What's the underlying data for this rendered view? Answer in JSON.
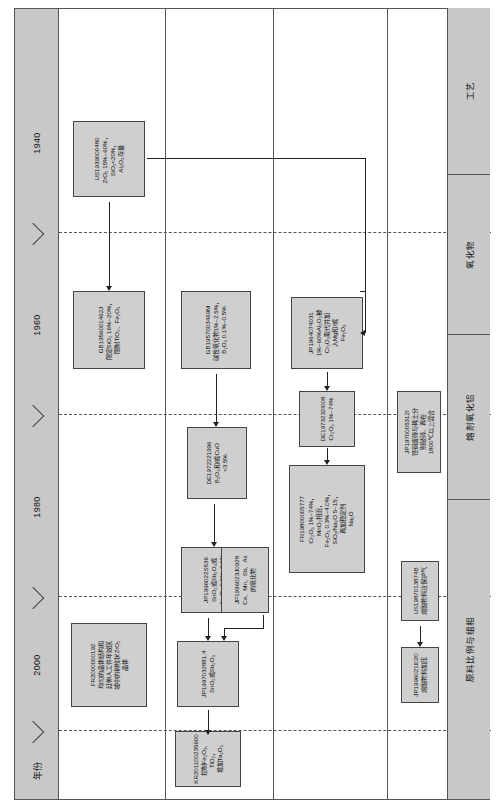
{
  "diagram": {
    "axis": {
      "header_label": "年份",
      "ticks": [
        "1940",
        "1960",
        "1980",
        "2000"
      ]
    },
    "lanes": [
      {
        "id": "lane-raw-material",
        "label": "原料比例与组相"
      },
      {
        "id": "lane-flux",
        "label": "熔剂氧化铝"
      },
      {
        "id": "lane-oxide",
        "label": "氧化物"
      },
      {
        "id": "lane-process",
        "label": "工艺"
      }
    ],
    "nodes": [
      {
        "id": "us1939000480",
        "lane": "lane-raw-material",
        "pid": "US1939000480",
        "desc": "ZrO₂ 15%~60%，\nSiO₂<20%，\nAl₂O₃存量"
      },
      {
        "id": "gb1956001462j",
        "lane": "lane-raw-material",
        "pid": "GB1956001462J",
        "desc": "限定SiO₂ 16%~20%，\n限制TiO₂、Fe₂O₃"
      },
      {
        "id": "fr2000000192",
        "lane": "lane-raw-material",
        "pid": "FR2000000192",
        "desc": "均匀的晶体结构和\n延伸人工件年效区\n域中的树枝状ZrO₂\n晶体"
      },
      {
        "id": "gb1957003469m",
        "lane": "lane-flux",
        "pid": "GB1957003469M",
        "desc": "碱性氧化物1%~2.5%，\nB₂O₃ 0.1%~0.5%"
      },
      {
        "id": "de1972221996",
        "lane": "lane-flux",
        "pid": "DE1972221996",
        "desc": "B₂O₃和/或CuO\n<3.5%"
      },
      {
        "id": "jp1996022s536",
        "lane": "lane-flux",
        "pid": "JP1996022S536",
        "desc": "SnO₂或Sb₂O₃或\nAs₂O₃ 0.1%~3.0%"
      },
      {
        "id": "jp1996023j0928",
        "lane": "lane-flux",
        "pid": "JP1996023J0928",
        "desc": "Ce、Mn、Sb、As\n的氧化物"
      },
      {
        "id": "jp1997032881.4",
        "lane": "lane-flux",
        "pid": "JP1997032881.4",
        "desc": "SnO₂或Sb₂O₃"
      },
      {
        "id": "kr201100235600",
        "lane": "lane-flux",
        "pid": "KR201100235600",
        "desc": "控制Fe₂O₃、TiO₂，\n增加Ta₂O₅"
      },
      {
        "id": "jp1964074031",
        "lane": "lane-oxide",
        "pid": "JP1964074031",
        "desc": "1%~60%Al₂O₃被\nCr₂O₃取代并加\n入Mg和/或\nFe₂O₃"
      },
      {
        "id": "de1973232i008",
        "lane": "lane-oxide",
        "pid": "DE1973232I008",
        "desc": "Cr₂O₃ 1%~74%"
      },
      {
        "id": "fr19800005777",
        "lane": "lane-oxide",
        "pid": "FR19800005777",
        "desc": "Cr₂O₃ 1%~74%，\nMnO₂相近，\nFe₂O₃ 0.3%~4.0%，\nSiO₂/Na₂O 5~15，\n再加稳定剂\nNa₂O"
      },
      {
        "id": "jp1970005312i",
        "lane": "lane-process",
        "pid": "JP1970005312I",
        "desc": "锆钢废砖与稀土分\n别破碎、再在\n1800℃以上混合"
      },
      {
        "id": "us1987013874b",
        "lane": "lane-process",
        "pid": "US1987013874B",
        "desc": "熔融物料注保护气"
      },
      {
        "id": "jp1996021i020",
        "lane": "lane-process",
        "pid": "JP1996021I020",
        "desc": "熔融物料加压"
      }
    ],
    "colors": {
      "node_fill": "#cfcfcf",
      "band_fill": "#c8c8c8",
      "line": "#555555",
      "connector": "#222222"
    }
  }
}
